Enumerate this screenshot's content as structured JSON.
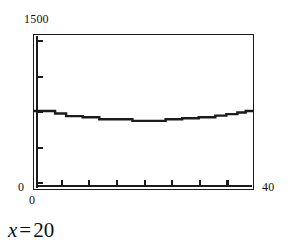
{
  "figure": {
    "caption_var": "x",
    "caption_eq": "=",
    "caption_value": "20"
  },
  "chart_data": {
    "type": "line",
    "title": "",
    "xlabel": "",
    "ylabel": "",
    "xlim": [
      0,
      40
    ],
    "ylim": [
      0,
      1500
    ],
    "x_tick_labels": [
      "0",
      "40"
    ],
    "y_tick_labels": [
      "0",
      "1500"
    ],
    "y_axis_max_label": "1500",
    "y_axis_min_label": "0",
    "x_axis_min_label": "0",
    "x_axis_max_label": "40",
    "grid": false,
    "legend": "none",
    "n_x_ticks_interior": 7,
    "n_y_ticks_interior": 5,
    "x_tick_interval": 5,
    "y_tick_interval": 250,
    "series": [
      {
        "name": "curve",
        "style": "step",
        "x": [
          0,
          2,
          4,
          6,
          9,
          12,
          15,
          18,
          21,
          24,
          27,
          30,
          33,
          35,
          37,
          38.5,
          40
        ],
        "values": [
          760,
          760,
          735,
          710,
          700,
          680,
          680,
          665,
          665,
          680,
          690,
          700,
          715,
          730,
          745,
          760,
          770
        ]
      }
    ]
  }
}
